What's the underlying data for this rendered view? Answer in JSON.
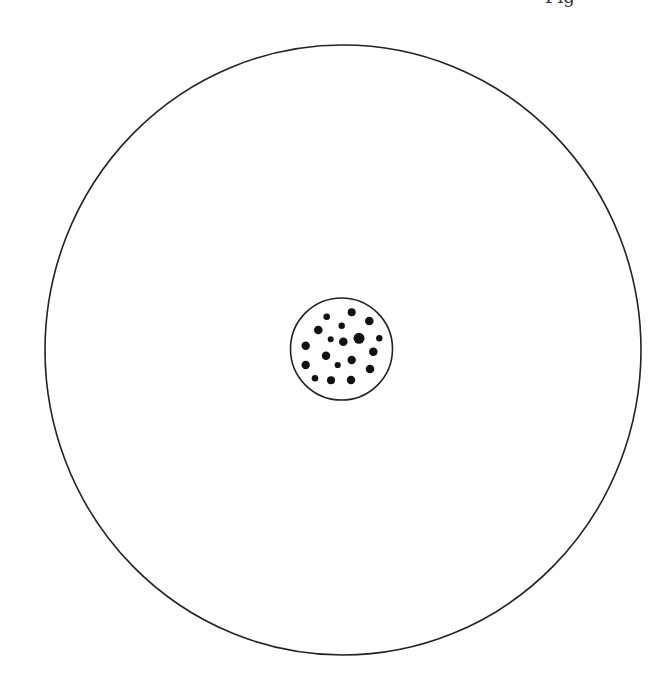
{
  "header": {
    "clipped_label": "Fig"
  },
  "diagram": {
    "stroke_color": "#222222",
    "dot_color": "#111111",
    "outer_circle": {
      "cx": 343,
      "cy": 350,
      "rx": 298,
      "ry": 305
    },
    "inner_circle": {
      "cx": 341.5,
      "cy": 349,
      "r": 51
    },
    "dots": [
      {
        "x": 326.7,
        "y": 316.7,
        "r": 3.3
      },
      {
        "x": 351.7,
        "y": 312.3,
        "r": 4.0
      },
      {
        "x": 369.3,
        "y": 321.0,
        "r": 4.3
      },
      {
        "x": 318.3,
        "y": 330.0,
        "r": 4.3
      },
      {
        "x": 341.7,
        "y": 325.7,
        "r": 3.2
      },
      {
        "x": 330.7,
        "y": 339.3,
        "r": 3.0
      },
      {
        "x": 343.3,
        "y": 341.7,
        "r": 4.3
      },
      {
        "x": 359.0,
        "y": 338.3,
        "r": 5.5
      },
      {
        "x": 379.3,
        "y": 338.3,
        "r": 3.2
      },
      {
        "x": 305.7,
        "y": 345.7,
        "r": 4.2
      },
      {
        "x": 373.3,
        "y": 351.7,
        "r": 4.3
      },
      {
        "x": 326.0,
        "y": 355.7,
        "r": 4.2
      },
      {
        "x": 351.7,
        "y": 360.0,
        "r": 4.2
      },
      {
        "x": 337.7,
        "y": 365.0,
        "r": 3.1
      },
      {
        "x": 305.7,
        "y": 365.0,
        "r": 4.2
      },
      {
        "x": 370.0,
        "y": 369.0,
        "r": 4.3
      },
      {
        "x": 315.0,
        "y": 378.3,
        "r": 3.3
      },
      {
        "x": 331.0,
        "y": 380.3,
        "r": 4.0
      },
      {
        "x": 351.0,
        "y": 380.0,
        "r": 4.2
      }
    ]
  }
}
